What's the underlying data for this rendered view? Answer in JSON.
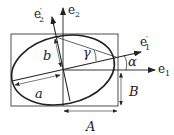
{
  "diagram": {
    "type": "ellipse-geometry",
    "labels": {
      "e1": "e",
      "e1_sub": "1",
      "e2": "e",
      "e2_sub": "2",
      "e1p": "e",
      "e1p_sub": "1",
      "e2p": "e",
      "e2p_sub": "2",
      "prime": "′",
      "a": "a",
      "b": "b",
      "A": "A",
      "B": "B",
      "alpha": "α",
      "gamma": "γ"
    },
    "colors": {
      "stroke": "#222222",
      "background": "#ffffff"
    }
  }
}
